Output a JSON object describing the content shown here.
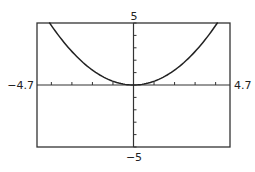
{
  "chart_data": {
    "type": "line",
    "title": "",
    "xlabel": "",
    "ylabel": "",
    "xlim": [
      -4.7,
      4.7
    ],
    "ylim": [
      -5,
      5
    ],
    "xscale": 1,
    "yscale": 1,
    "grid": false,
    "window_labels": {
      "xmin": "−4.7",
      "xmax": "4.7",
      "ymin": "−5",
      "ymax": "5"
    },
    "series": [
      {
        "name": "curve",
        "equation": "y = 0.3x^2",
        "coefficient": 0.3,
        "x_range": [
          -4.1,
          4.1
        ]
      }
    ],
    "colors": {
      "curve": "#222222",
      "axes": "#333333",
      "frame": "#333333"
    }
  }
}
